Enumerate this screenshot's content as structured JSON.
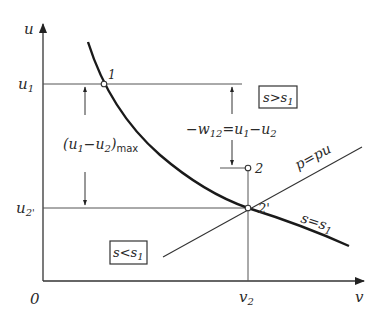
{
  "diagram": {
    "type": "u-v state diagram (internal energy vs. specific volume)",
    "axes": {
      "y_label": "u",
      "x_label": "v",
      "origin_label": "0",
      "y_ticks": [
        {
          "main": "u",
          "sub": "1"
        },
        {
          "main": "u",
          "sub": "2'"
        }
      ],
      "x_ticks": [
        {
          "main": "v",
          "sub": "2"
        }
      ]
    },
    "points": [
      {
        "id": "1",
        "label": "1"
      },
      {
        "id": "2",
        "label": "2"
      },
      {
        "id": "2p",
        "label": "2'"
      }
    ],
    "curves": [
      {
        "id": "isentrope",
        "label_main": "s",
        "label_eq": "=",
        "label_rhs_main": "s",
        "label_rhs_sub": "1"
      },
      {
        "id": "isobar",
        "label": "p=pu"
      }
    ],
    "regions": [
      {
        "id": "above",
        "main": "s",
        "op": ">",
        "rhs_main": "s",
        "rhs_sub": "1"
      },
      {
        "id": "below",
        "main": "s",
        "op": "<",
        "rhs_main": "s",
        "rhs_sub": "1"
      }
    ],
    "annotations": {
      "max_diff": {
        "open": "(u",
        "sub1": "1",
        "mid": "−u",
        "sub2": "2",
        "close": ")",
        "suffix": "max"
      },
      "work": {
        "prefix": "−w",
        "sub_w": "12",
        "eq": "=u",
        "sub1": "1",
        "minus": "−u",
        "sub2": "2"
      }
    }
  }
}
